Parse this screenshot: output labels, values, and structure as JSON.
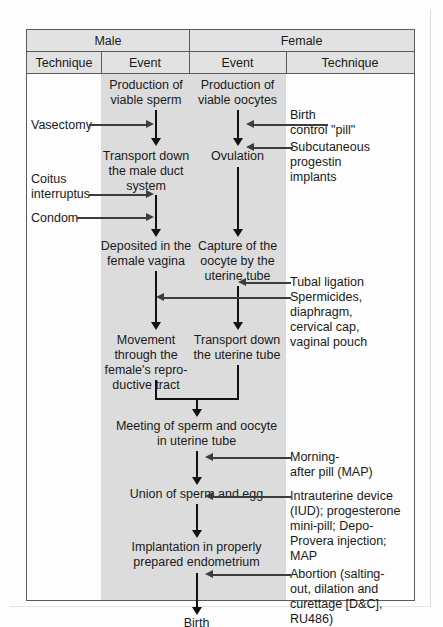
{
  "diagram": {
    "headers": {
      "group_male": "Male",
      "group_female": "Female",
      "male_technique": "Technique",
      "male_event": "Event",
      "female_event": "Event",
      "female_technique": "Technique"
    },
    "male_events": [
      {
        "id": "m1",
        "label": "Production of\nviable sperm"
      },
      {
        "id": "m2",
        "label": "Transport down\nthe  male duct\nsystem"
      },
      {
        "id": "m3",
        "label": "Deposited in the\nfemale vagina"
      },
      {
        "id": "m4",
        "label": "Movement\nthrough the\nfemale's repro-\nductive tract"
      }
    ],
    "female_events": [
      {
        "id": "f1",
        "label": "Production of\nviable oocytes"
      },
      {
        "id": "f2",
        "label": "Ovulation"
      },
      {
        "id": "f3",
        "label": "Capture of the\noocyte  by the\nuterine tube"
      },
      {
        "id": "f4",
        "label": "Transport down\nthe uterine tube"
      }
    ],
    "shared_events": [
      {
        "id": "s1",
        "label": "Meeting of sperm and oocyte\nin uterine tube"
      },
      {
        "id": "s2",
        "label": "Union of sperm and egg"
      },
      {
        "id": "s3",
        "label": "Implantation in properly\nprepared endometrium"
      },
      {
        "id": "s4",
        "label": "Birth"
      }
    ],
    "male_techniques": [
      {
        "id": "mt1",
        "label": "Vasectomy"
      },
      {
        "id": "mt2",
        "label": "Coitus\ninterruptus"
      },
      {
        "id": "mt3",
        "label": "Condom"
      }
    ],
    "female_techniques": [
      {
        "id": "ft1",
        "label": "Birth\ncontrol \"pill\""
      },
      {
        "id": "ft2",
        "label": "Subcutaneous\nprogestin\nimplants"
      },
      {
        "id": "ft3",
        "label": "Tubal ligation"
      },
      {
        "id": "ft4",
        "label": "Spermicides,\ndiaphragm,\ncervical  cap,\nvaginal pouch"
      },
      {
        "id": "ft5",
        "label": "Morning-\nafter pill (MAP)"
      },
      {
        "id": "ft6",
        "label": "Intrauterine device\n(IUD); progesterone\nmini-pill; Depo-\nProvera injection;\nMAP"
      },
      {
        "id": "ft7",
        "label": "Abortion (salting-\nout,  dilation and\ncurettage [D&C],\nRU486)"
      }
    ],
    "colors": {
      "shade": "#dcdcdc",
      "header_fill": "#e2e2e2",
      "border": "#5a5a5a",
      "arrow": "#111111",
      "thin_arrow": "#3c3c3c",
      "page_bg": "#fdfdfd"
    }
  }
}
